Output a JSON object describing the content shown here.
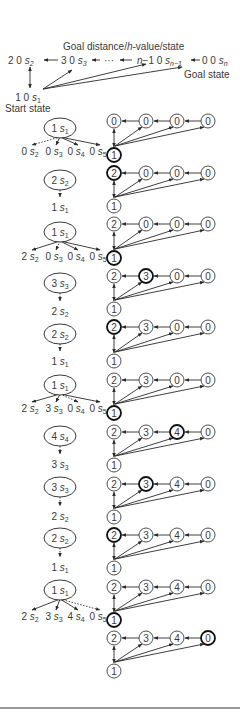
{
  "header": {
    "title": "Goal distance/h-value/state",
    "title_parts": [
      "Goal distance/",
      "h",
      "-value/state"
    ],
    "start_label": "Start state",
    "goal_label": "Goal state",
    "chain": [
      {
        "x": 8,
        "text": "2 0 s",
        "sub": "2"
      },
      {
        "x": 61,
        "text": "3 0 s",
        "sub": "3"
      },
      {
        "x": 104,
        "text": "···",
        "sub": ""
      },
      {
        "x": 137,
        "text": "n−1 0 s",
        "sub": "n−1"
      },
      {
        "x": 202,
        "text": "0 0 s",
        "sub": "n"
      }
    ],
    "start_node": {
      "text": "1 0 s",
      "sub": "1"
    }
  },
  "left_column": {
    "trees": [
      {
        "parent": {
          "y": 128,
          "num": "1",
          "sub": "1"
        },
        "child_y": 155,
        "children": [
          {
            "x": 30,
            "num": "0",
            "sub": "2",
            "dashed": true
          },
          {
            "x": 54,
            "num": "0",
            "sub": "3",
            "dashed": false
          },
          {
            "x": 76,
            "num": "0",
            "sub": "4",
            "dashed": false
          },
          {
            "x": 98,
            "num": "0",
            "sub": "5",
            "dashed": false
          }
        ]
      },
      {
        "parent": {
          "y": 232,
          "num": "1",
          "sub": "1"
        },
        "child_y": 260,
        "children": [
          {
            "x": 30,
            "num": "2",
            "sub": "2",
            "dashed": false
          },
          {
            "x": 54,
            "num": "0",
            "sub": "3",
            "dashed": true
          },
          {
            "x": 76,
            "num": "0",
            "sub": "4",
            "dashed": false
          },
          {
            "x": 98,
            "num": "0",
            "sub": "5",
            "dashed": false
          }
        ]
      },
      {
        "parent": {
          "y": 385,
          "num": "1",
          "sub": "1"
        },
        "child_y": 412,
        "children": [
          {
            "x": 30,
            "num": "2",
            "sub": "2",
            "dashed": false
          },
          {
            "x": 54,
            "num": "3",
            "sub": "3",
            "dashed": false
          },
          {
            "x": 76,
            "num": "0",
            "sub": "4",
            "dashed": true
          },
          {
            "x": 98,
            "num": "0",
            "sub": "5",
            "dashed": false
          }
        ]
      },
      {
        "parent": {
          "y": 590,
          "num": "1",
          "sub": "1"
        },
        "child_y": 620,
        "children": [
          {
            "x": 30,
            "num": "2",
            "sub": "2",
            "dashed": false
          },
          {
            "x": 54,
            "num": "3",
            "sub": "3",
            "dashed": false
          },
          {
            "x": 76,
            "num": "4",
            "sub": "4",
            "dashed": false
          },
          {
            "x": 98,
            "num": "0",
            "sub": "5",
            "dashed": true
          }
        ]
      }
    ],
    "chains": [
      {
        "from": {
          "y": 180,
          "num": "2",
          "sub": "2"
        },
        "to": {
          "y": 207,
          "num": "1",
          "sub": "1"
        }
      },
      {
        "from": {
          "y": 283,
          "num": "3",
          "sub": "3"
        },
        "to": {
          "y": 311,
          "num": "2",
          "sub": "2"
        }
      },
      {
        "from": {
          "y": 334,
          "num": "2",
          "sub": "2"
        },
        "to": {
          "y": 361,
          "num": "1",
          "sub": "1"
        }
      },
      {
        "from": {
          "y": 436,
          "num": "4",
          "sub": "4"
        },
        "to": {
          "y": 464,
          "num": "3",
          "sub": "3"
        }
      },
      {
        "from": {
          "y": 487,
          "num": "3",
          "sub": "3"
        },
        "to": {
          "y": 516,
          "num": "2",
          "sub": "2"
        }
      },
      {
        "from": {
          "y": 538,
          "num": "2",
          "sub": "2"
        },
        "to": {
          "y": 567,
          "num": "1",
          "sub": "1"
        }
      }
    ]
  },
  "right_column": {
    "node_x": [
      114,
      146,
      177,
      208
    ],
    "diagrams": [
      {
        "top_y": 121,
        "bottom_y": 155,
        "values": [
          "0",
          "0",
          "0",
          "0"
        ],
        "bottom": "1",
        "bold": "bottom"
      },
      {
        "top_y": 173,
        "bottom_y": 206,
        "values": [
          "2",
          "0",
          "0",
          "0"
        ],
        "bottom": "1",
        "bold": 0
      },
      {
        "top_y": 224,
        "bottom_y": 258,
        "values": [
          "2",
          "0",
          "0",
          "0"
        ],
        "bottom": "1",
        "bold": "bottom"
      },
      {
        "top_y": 276,
        "bottom_y": 309,
        "values": [
          "2",
          "3",
          "0",
          "0"
        ],
        "bottom": "1",
        "bold": 1
      },
      {
        "top_y": 327,
        "bottom_y": 361,
        "values": [
          "2",
          "3",
          "0",
          "0"
        ],
        "bottom": "1",
        "bold": 0
      },
      {
        "top_y": 380,
        "bottom_y": 413,
        "values": [
          "2",
          "3",
          "0",
          "0"
        ],
        "bottom": "1",
        "bold": "bottom"
      },
      {
        "top_y": 432,
        "bottom_y": 465,
        "values": [
          "2",
          "3",
          "4",
          "0"
        ],
        "bottom": "1",
        "bold": 2
      },
      {
        "top_y": 484,
        "bottom_y": 517,
        "values": [
          "2",
          "3",
          "4",
          "0"
        ],
        "bottom": "1",
        "bold": 1
      },
      {
        "top_y": 535,
        "bottom_y": 568,
        "values": [
          "2",
          "3",
          "4",
          "0"
        ],
        "bottom": "1",
        "bold": 0
      },
      {
        "top_y": 587,
        "bottom_y": 620,
        "values": [
          "2",
          "3",
          "4",
          "0"
        ],
        "bottom": "1",
        "bold": "bottom"
      },
      {
        "top_y": 638,
        "bottom_y": 671,
        "values": [
          "2",
          "3",
          "4",
          "0"
        ],
        "bottom": "1",
        "bold": 3
      }
    ]
  },
  "colors": {
    "ink": "#2a2a2a",
    "text": "#3a3a3a",
    "rule": "#777777",
    "background": "#ffffff"
  }
}
